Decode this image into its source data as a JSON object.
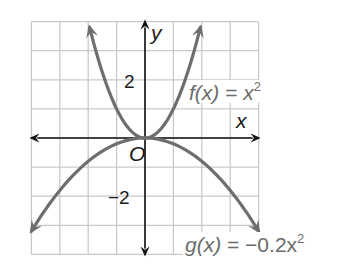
{
  "chart_data": {
    "type": "line",
    "title": "",
    "xlabel": "x",
    "ylabel": "y",
    "origin_label": "O",
    "xlim": [
      -4,
      4
    ],
    "ylim": [
      -4,
      4
    ],
    "grid": true,
    "grid_step": 1,
    "tick_labels": {
      "y": [
        {
          "value": 2,
          "label": "2"
        },
        {
          "value": -2,
          "label": "−2"
        }
      ]
    },
    "series": [
      {
        "name": "f(x) = x^2",
        "label_parts": {
          "fn": "f(x)",
          "eq": " = ",
          "rhs": "x",
          "exp": "2"
        },
        "expression": "x^2",
        "coefficient": 1,
        "color": "#6e6e6e",
        "x_range": [
          -1.95,
          1.95
        ],
        "points": [
          [
            -1.95,
            3.8
          ],
          [
            -1.5,
            2.25
          ],
          [
            -1,
            1
          ],
          [
            -0.5,
            0.25
          ],
          [
            0,
            0
          ],
          [
            0.5,
            0.25
          ],
          [
            1,
            1
          ],
          [
            1.5,
            2.25
          ],
          [
            1.95,
            3.8
          ]
        ]
      },
      {
        "name": "g(x) = -0.2x^2",
        "label_parts": {
          "fn": "g(x)",
          "eq": " = ",
          "rhs": "−0.2x",
          "exp": "2"
        },
        "expression": "-0.2x^2",
        "coefficient": -0.2,
        "color": "#6e6e6e",
        "x_range": [
          -4,
          4
        ],
        "points": [
          [
            -4,
            -3.2
          ],
          [
            -3,
            -1.8
          ],
          [
            -2,
            -0.8
          ],
          [
            -1,
            -0.2
          ],
          [
            0,
            0
          ],
          [
            1,
            -0.2
          ],
          [
            2,
            -0.8
          ],
          [
            3,
            -1.8
          ],
          [
            4,
            -3.2
          ]
        ]
      }
    ],
    "colors": {
      "axes": "#111111",
      "grid": "#c9c9c9",
      "curves": "#6e6e6e",
      "labels": "#6b6b6b"
    }
  }
}
